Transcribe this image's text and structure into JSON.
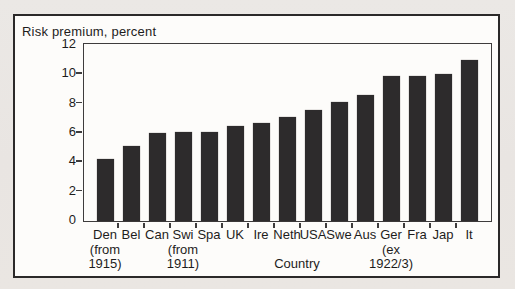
{
  "chart_data": {
    "type": "bar",
    "title": "Risk premium, percent",
    "xlabel": "Country",
    "ylabel": "Risk premium, percent",
    "ylim": [
      0,
      12
    ],
    "yticks": [
      0,
      2,
      4,
      6,
      8,
      10,
      12
    ],
    "grid": false,
    "legend": "none",
    "bar_color": "#2d2b2c",
    "axis_color": "#3e3c3c",
    "categories": [
      "Den",
      "Bel",
      "Can",
      "Swi",
      "Spa",
      "UK",
      "Ire",
      "Neth",
      "USA",
      "Swe",
      "Aus",
      "Ger",
      "Fra",
      "Jap",
      "It"
    ],
    "category_label_lines": [
      [
        "Den",
        "(from",
        "1915)"
      ],
      [
        "Bel"
      ],
      [
        "Can"
      ],
      [
        "Swi",
        "(from",
        "1911)"
      ],
      [
        "Spa"
      ],
      [
        "UK"
      ],
      [
        "Ire"
      ],
      [
        "Neth"
      ],
      [
        "USA"
      ],
      [
        "Swe"
      ],
      [
        "Aus"
      ],
      [
        "Ger",
        "(ex",
        "1922/3)"
      ],
      [
        "Fra"
      ],
      [
        "Jap"
      ],
      [
        "It"
      ]
    ],
    "values": [
      4.2,
      5.1,
      6.0,
      6.1,
      6.1,
      6.5,
      6.7,
      7.1,
      7.6,
      8.1,
      8.6,
      9.9,
      9.9,
      10.0,
      11.0
    ]
  }
}
